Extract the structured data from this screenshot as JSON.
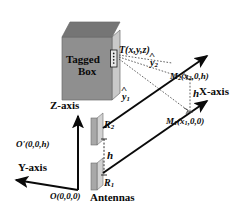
{
  "figure": {
    "type": "diagram",
    "background_color": "#ffffff",
    "ink_color": "#0a0a0a"
  },
  "box": {
    "label_line1": "Tagged",
    "label_line2": "Box",
    "front_color": "#8f8f8f",
    "top_color": "#757575",
    "side_color": "#c9c9c9"
  },
  "tag": {
    "point_label": "T(x,y,z)",
    "marker_name": "rfid-tag"
  },
  "antennas": {
    "caption": "Antennas",
    "upper_label": "R",
    "upper_sub": "2",
    "lower_label": "R",
    "lower_sub": "1",
    "separation_label": "h",
    "body_color": "#a8a8a8",
    "edge_color": "#d2d2d2"
  },
  "axes": {
    "x_label": "X-axis",
    "y_label": "Y-axis",
    "z_label": "Z-axis",
    "origin_label": "O(0,0,0)",
    "origin_prime_label": "O'(0,0,h)"
  },
  "measurements": {
    "m2_label": "M",
    "m2_sub": "2",
    "m2_coords": "(x",
    "m2_coords_sub": "2",
    "m2_coords_tail": ",0,h)",
    "m1_label": "M",
    "m1_sub": "1",
    "m1_coords": "(x",
    "m1_coords_sub": "1",
    "m1_coords_tail": ",0,0)",
    "height_label": "h"
  },
  "distances": {
    "y2_label": "y",
    "y2_sub": "2",
    "y1_label": "y",
    "y1_sub": "1"
  }
}
